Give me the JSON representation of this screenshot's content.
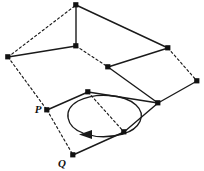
{
  "figure": {
    "background_color": "#ffffff",
    "stroke_color": "#1a1a1a",
    "vertex_color": "#111111",
    "width": 204,
    "height": 171,
    "labels": [
      {
        "id": "label-p",
        "text": "P",
        "x": 38,
        "y": 113
      },
      {
        "id": "label-q",
        "text": "Q",
        "x": 62,
        "y": 167
      }
    ],
    "vertices": [
      {
        "id": "v-top",
        "x": 76,
        "y": 5
      },
      {
        "id": "v-left",
        "x": 8,
        "y": 57
      },
      {
        "id": "v-mid-upper",
        "x": 76,
        "y": 46
      },
      {
        "id": "v-right-upper",
        "x": 168,
        "y": 48
      },
      {
        "id": "v-inner-left",
        "x": 108,
        "y": 67
      },
      {
        "id": "v-far-right",
        "x": 197,
        "y": 81
      },
      {
        "id": "v-center",
        "x": 88,
        "y": 92
      },
      {
        "id": "v-junction",
        "x": 158,
        "y": 103
      },
      {
        "id": "v-p",
        "x": 47,
        "y": 110
      },
      {
        "id": "v-lower-right",
        "x": 124,
        "y": 132
      },
      {
        "id": "v-q",
        "x": 73,
        "y": 155
      }
    ],
    "solid_edges": [
      {
        "id": "edge-top-mid",
        "from": "v-top",
        "to": "v-mid-upper"
      },
      {
        "id": "edge-top-right-upper",
        "from": "v-top",
        "to": "v-right-upper"
      },
      {
        "id": "edge-left-mid",
        "from": "v-left",
        "to": "v-mid-upper"
      },
      {
        "id": "edge-inner-right-upper",
        "from": "v-inner-left",
        "to": "v-right-upper"
      },
      {
        "id": "edge-inner-junction",
        "from": "v-inner-left",
        "to": "v-junction"
      },
      {
        "id": "edge-junction-far-right",
        "from": "v-junction",
        "to": "v-far-right"
      },
      {
        "id": "edge-p-center",
        "from": "v-p",
        "to": "v-center"
      },
      {
        "id": "edge-center-junction",
        "from": "v-center",
        "to": "v-junction"
      },
      {
        "id": "edge-junction-lower",
        "from": "v-junction",
        "to": "v-lower-right"
      },
      {
        "id": "edge-lower-q",
        "from": "v-lower-right",
        "to": "v-q"
      }
    ],
    "dashed_edges": [
      {
        "id": "dedge-left-top",
        "from": "v-left",
        "to": "v-top"
      },
      {
        "id": "dedge-mid-inner",
        "from": "v-mid-upper",
        "to": "v-inner-left"
      },
      {
        "id": "dedge-right-far",
        "from": "v-right-upper",
        "to": "v-far-right"
      },
      {
        "id": "dedge-left-p",
        "from": "v-left",
        "to": "v-p"
      },
      {
        "id": "dedge-p-q",
        "from": "v-p",
        "to": "v-q"
      },
      {
        "id": "dedge-center-lower",
        "from": "v-center",
        "to": "v-lower-right"
      }
    ],
    "loop": {
      "id": "orientation-loop",
      "center_x": 104,
      "center_y": 116,
      "radius_x": 36,
      "radius_y": 22,
      "rotation_deg": -8,
      "direction": "counterclockwise",
      "arrowhead_x": 82,
      "arrowhead_y": 135
    }
  }
}
